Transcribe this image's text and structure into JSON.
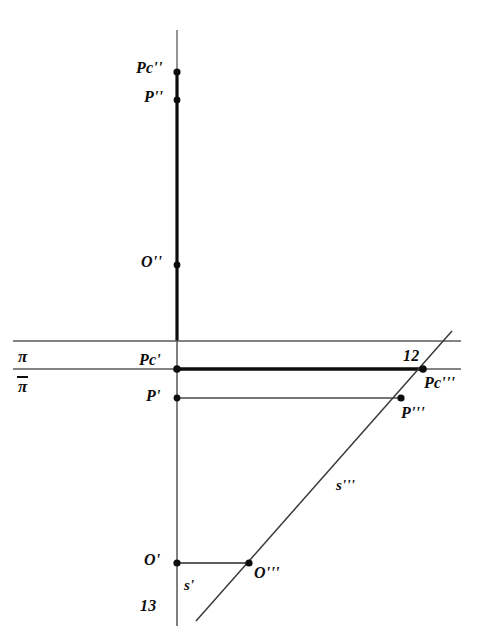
{
  "figure": {
    "width": 479,
    "height": 632,
    "background": "#ffffff",
    "ink": "#0d0d0d"
  },
  "labels": {
    "pc_second": "Pc''",
    "p_second": "P''",
    "o_second": "O''",
    "pc_first": "Pc'",
    "p_first": "P'",
    "o_first": "O'",
    "pc_third": "Pc'''",
    "p_third": "P'''",
    "o_third": "O'''",
    "s_first": "s'",
    "s_third": "s'''",
    "plane_pi": "π",
    "plane_pi_bar": "π",
    "number_12": "12",
    "number_13": "13"
  },
  "geometry": {
    "vertical_axis": {
      "x": 177,
      "y_top": 30,
      "y_bottom": 626,
      "thin_until_y": 72
    },
    "ground_line_upper": {
      "x1": 13,
      "x2": 461,
      "y": 341
    },
    "ground_line_pi": {
      "x1": 13,
      "x2": 461,
      "y": 369,
      "bold_from_x": 177,
      "bold_to_x": 423
    },
    "p_first_connector": {
      "x1": 177,
      "x2": 401,
      "y": 398
    },
    "o_first_connector": {
      "x1": 177,
      "x2": 249,
      "y": 563
    },
    "oblique_line_s3": {
      "x1": 196,
      "y1": 621,
      "x2": 452,
      "y2": 331
    }
  },
  "points": [
    {
      "name": "pc-second",
      "label": "Pc''",
      "x": 177,
      "y": 72
    },
    {
      "name": "p-second",
      "label": "P''",
      "x": 177,
      "y": 100
    },
    {
      "name": "o-second",
      "label": "O''",
      "x": 177,
      "y": 265
    },
    {
      "name": "pc-first",
      "label": "Pc'",
      "x": 177,
      "y": 369
    },
    {
      "name": "p-first",
      "label": "P'",
      "x": 177,
      "y": 398
    },
    {
      "name": "pc-third",
      "label": "Pc'''",
      "x": 423,
      "y": 369
    },
    {
      "name": "p-third",
      "label": "P'''",
      "x": 401,
      "y": 398
    },
    {
      "name": "o-first",
      "label": "O'",
      "x": 177,
      "y": 563
    },
    {
      "name": "o-third",
      "label": "O'''",
      "x": 249,
      "y": 563
    }
  ],
  "label_positions": {
    "pc_second": {
      "x": 136,
      "y": 60
    },
    "p_second": {
      "x": 144,
      "y": 89
    },
    "o_second": {
      "x": 141,
      "y": 254
    },
    "pc_first": {
      "x": 139,
      "y": 352
    },
    "p_first": {
      "x": 146,
      "y": 388
    },
    "o_first": {
      "x": 144,
      "y": 552
    },
    "pc_third": {
      "x": 424,
      "y": 375
    },
    "p_third": {
      "x": 401,
      "y": 405
    },
    "o_third": {
      "x": 254,
      "y": 565
    },
    "s_first": {
      "x": 184,
      "y": 578
    },
    "s_third": {
      "x": 336,
      "y": 478
    },
    "plane_pi": {
      "x": 18,
      "y": 348
    },
    "plane_pi_bar": {
      "x": 18,
      "y": 377
    },
    "number_12": {
      "x": 403,
      "y": 348
    },
    "number_13": {
      "x": 140,
      "y": 598
    }
  }
}
